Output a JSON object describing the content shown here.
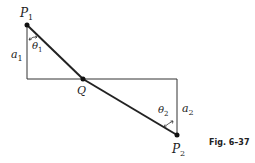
{
  "figure": {
    "caption": "Fig. 6–37",
    "colors": {
      "line": "#222222",
      "frame": "#333333",
      "background": "#ffffff"
    }
  },
  "points": {
    "P1": {
      "label": "P",
      "sub": "1"
    },
    "P2": {
      "label": "P",
      "sub": "2"
    },
    "Q": {
      "label": "Q"
    }
  },
  "distances": {
    "a1": {
      "label": "a",
      "sub": "1"
    },
    "a2": {
      "label": "a",
      "sub": "2"
    }
  },
  "angles": {
    "theta1": {
      "label": "θ",
      "sub": "1"
    },
    "theta2": {
      "label": "θ",
      "sub": "2"
    }
  }
}
